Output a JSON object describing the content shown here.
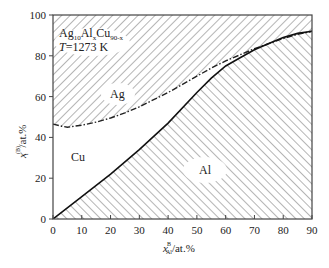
{
  "chart_data": {
    "type": "line",
    "title": "",
    "annotation": {
      "composition": "Ag10AlxCu90-x",
      "temperature": "T=1273 K"
    },
    "xlabel": "x_Al^B/at.%",
    "ylabel": "x_i^(B)/at.%",
    "xlim": [
      0,
      90
    ],
    "ylim": [
      0,
      100
    ],
    "xticks": [
      0,
      10,
      20,
      30,
      40,
      50,
      60,
      70,
      80,
      90
    ],
    "yticks": [
      0,
      20,
      40,
      60,
      80,
      100
    ],
    "grid": false,
    "regions": [
      {
        "name": "Ag",
        "hatch": "/",
        "position": "upper"
      },
      {
        "name": "Cu",
        "hatch": "none",
        "position": "middle"
      },
      {
        "name": "Al",
        "hatch": "\\",
        "position": "lower"
      }
    ],
    "series": [
      {
        "name": "Al boundary (solid)",
        "style": "solid",
        "x": [
          0,
          10,
          20,
          30,
          40,
          50,
          55,
          60,
          65,
          70,
          75,
          80,
          85,
          90
        ],
        "values": [
          0,
          11,
          22,
          34,
          47,
          62,
          69,
          75,
          79,
          83,
          86,
          89,
          91,
          92
        ]
      },
      {
        "name": "Al+Cu boundary (dash-dot)",
        "style": "dash-dot",
        "x": [
          0,
          3,
          5,
          10,
          15,
          20,
          25,
          30,
          35,
          40,
          45,
          50,
          55,
          60,
          65,
          70,
          75,
          80,
          85,
          90
        ],
        "values": [
          46.5,
          45.5,
          45,
          46,
          47.5,
          49.5,
          52,
          55,
          58.5,
          62,
          66,
          70,
          74,
          77.5,
          80.5,
          83.5,
          86,
          88.5,
          90.5,
          92
        ]
      }
    ]
  },
  "labels": {
    "ag": "Ag",
    "cu": "Cu",
    "al": "Al",
    "composition_base": "Ag",
    "composition_sub1": "10",
    "composition_mid": "Al",
    "composition_sub2": "x",
    "composition_end": "Cu",
    "composition_sub3": "90-x",
    "temp_italic": "T",
    "temp_value": "=1273 K",
    "xlabel_main": "x",
    "xlabel_sup": "B",
    "xlabel_sub": "Al",
    "xlabel_unit": "/at.%",
    "ylabel_main": "x",
    "ylabel_sup": "(B)",
    "ylabel_sub": "i",
    "ylabel_unit": "/at.%"
  }
}
